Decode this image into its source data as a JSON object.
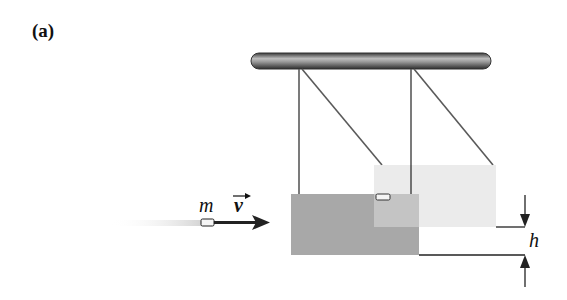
{
  "figure": {
    "panel_label": "(a)",
    "labels": {
      "mass": "m",
      "velocity": "v",
      "height": "h"
    },
    "colors": {
      "rod": "#6e6e6e",
      "strings": "#555555",
      "block_initial": "#a9a9a9",
      "block_raised": "#e3e3e3",
      "arrow": "#222222"
    }
  }
}
